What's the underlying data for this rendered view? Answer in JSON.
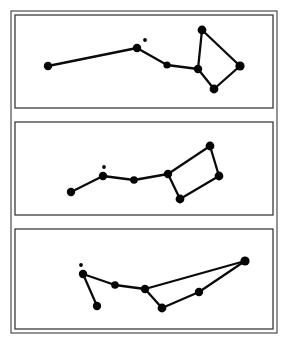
{
  "figure": {
    "background_color": "#ffffff",
    "ink_color": "#050505",
    "frame_color": "#3c3c3c",
    "panel_border_color": "#2b2b2b",
    "width": 289,
    "height": 348,
    "panel_count": 3
  },
  "outer_frame": {
    "x": 11,
    "y": 11,
    "width": 266,
    "height": 322
  },
  "panels": [
    {
      "id": "panel-top",
      "label": "Panel 1",
      "box": {
        "x": 15,
        "y": 15,
        "width": 258,
        "height": 93
      },
      "stars": [
        {
          "name": "alkaid",
          "x": 48,
          "y": 66,
          "r": 4.2
        },
        {
          "name": "mizar",
          "x": 137,
          "y": 48,
          "r": 4.2
        },
        {
          "name": "alcor",
          "x": 145,
          "y": 40,
          "r": 1.9,
          "companion": true
        },
        {
          "name": "alioth",
          "x": 167,
          "y": 65,
          "r": 3.6
        },
        {
          "name": "megrez",
          "x": 198,
          "y": 69,
          "r": 4.2
        },
        {
          "name": "dubhe",
          "x": 202,
          "y": 30,
          "r": 4.4
        },
        {
          "name": "merak",
          "x": 240,
          "y": 66,
          "r": 4.6
        },
        {
          "name": "phecda",
          "x": 214,
          "y": 89,
          "r": 4.4
        }
      ],
      "links": [
        [
          "alkaid",
          "mizar"
        ],
        [
          "mizar",
          "alioth"
        ],
        [
          "alioth",
          "megrez"
        ],
        [
          "megrez",
          "dubhe"
        ],
        [
          "dubhe",
          "merak"
        ],
        [
          "merak",
          "phecda"
        ],
        [
          "phecda",
          "megrez"
        ]
      ]
    },
    {
      "id": "panel-middle",
      "label": "Panel 2",
      "box": {
        "x": 15,
        "y": 122,
        "width": 258,
        "height": 93
      },
      "stars": [
        {
          "name": "alkaid",
          "x": 71,
          "y": 192,
          "r": 4.2
        },
        {
          "name": "mizar",
          "x": 103,
          "y": 176,
          "r": 4.2
        },
        {
          "name": "alcor",
          "x": 104,
          "y": 167,
          "r": 1.9,
          "companion": true
        },
        {
          "name": "alioth",
          "x": 134,
          "y": 180,
          "r": 3.8
        },
        {
          "name": "megrez",
          "x": 168,
          "y": 174,
          "r": 4.2
        },
        {
          "name": "dubhe",
          "x": 210,
          "y": 146,
          "r": 4.4
        },
        {
          "name": "merak",
          "x": 219,
          "y": 176,
          "r": 4.4
        },
        {
          "name": "phecda",
          "x": 180,
          "y": 199,
          "r": 4.4
        }
      ],
      "links": [
        [
          "alkaid",
          "mizar"
        ],
        [
          "mizar",
          "alioth"
        ],
        [
          "alioth",
          "megrez"
        ],
        [
          "megrez",
          "dubhe"
        ],
        [
          "dubhe",
          "merak"
        ],
        [
          "merak",
          "phecda"
        ],
        [
          "phecda",
          "megrez"
        ]
      ]
    },
    {
      "id": "panel-bottom",
      "label": "Panel 3",
      "box": {
        "x": 15,
        "y": 229,
        "width": 258,
        "height": 100
      },
      "stars": [
        {
          "name": "alkaid",
          "x": 97,
          "y": 306,
          "r": 4.2
        },
        {
          "name": "mizar",
          "x": 83,
          "y": 274,
          "r": 4.2
        },
        {
          "name": "alcor",
          "x": 81,
          "y": 265,
          "r": 1.9,
          "companion": true
        },
        {
          "name": "alioth",
          "x": 115,
          "y": 285,
          "r": 3.8
        },
        {
          "name": "megrez",
          "x": 145,
          "y": 289,
          "r": 4.2
        },
        {
          "name": "dubhe",
          "x": 245,
          "y": 261,
          "r": 4.6
        },
        {
          "name": "merak",
          "x": 199,
          "y": 292,
          "r": 4.2
        },
        {
          "name": "phecda",
          "x": 162,
          "y": 308,
          "r": 4.4
        }
      ],
      "links": [
        [
          "alkaid",
          "mizar"
        ],
        [
          "mizar",
          "alioth"
        ],
        [
          "alioth",
          "megrez"
        ],
        [
          "megrez",
          "dubhe"
        ],
        [
          "dubhe",
          "merak"
        ],
        [
          "merak",
          "phecda"
        ],
        [
          "phecda",
          "megrez"
        ]
      ]
    }
  ]
}
